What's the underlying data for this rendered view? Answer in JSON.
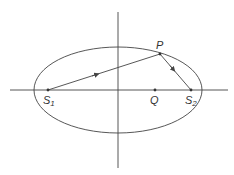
{
  "diagram": {
    "type": "ellipse-with-foci",
    "colors": {
      "stroke": "#444444",
      "text": "#333333",
      "background": "#ffffff"
    },
    "axes": {
      "horizontal": {
        "x1": 10,
        "y": 90,
        "x2": 228
      },
      "vertical": {
        "x": 118,
        "y1": 12,
        "y2": 168
      }
    },
    "ellipse": {
      "cx": 118,
      "cy": 90,
      "rx": 84,
      "ry": 43
    },
    "points": {
      "S1": {
        "label": "S",
        "subscript": "1",
        "x": 48,
        "y": 90
      },
      "S2": {
        "label": "S",
        "subscript": "2",
        "x": 191,
        "y": 90
      },
      "Q": {
        "label": "Q",
        "x": 155,
        "y": 90
      },
      "P": {
        "label": "P",
        "x": 160,
        "y": 54
      }
    },
    "segments": [
      {
        "from": "S1",
        "to": "P",
        "arrow_direction": "toward P"
      },
      {
        "from": "P",
        "to": "S2",
        "arrow_direction": "toward S2"
      }
    ]
  }
}
